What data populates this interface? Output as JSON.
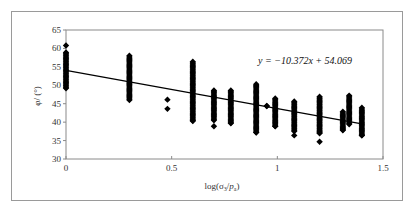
{
  "chart_data": {
    "type": "scatter",
    "title": "",
    "xlabel": "log(σ3/pa)",
    "ylabel": "φ/ (°)",
    "xlim": [
      0,
      1.5
    ],
    "ylim": [
      30,
      65
    ],
    "xticks": [
      0,
      0.5,
      1,
      1.5
    ],
    "xtick_labels": [
      "0",
      "0.5",
      "1",
      "1.5"
    ],
    "yticks": [
      30,
      35,
      40,
      45,
      50,
      55,
      60,
      65
    ],
    "ytick_labels": [
      "30",
      "35",
      "40",
      "45",
      "50",
      "55",
      "60",
      "65"
    ],
    "grid": false,
    "legend": null,
    "marker": "diamond",
    "marker_color": "#000000",
    "series": [
      {
        "name": "measured",
        "clusters": [
          {
            "x": 0.0,
            "y_min": 49.2,
            "y_max": 58.9,
            "extra": [
              60.8
            ]
          },
          {
            "x": 0.3,
            "y_min": 46.0,
            "y_max": 58.0,
            "extra": []
          },
          {
            "x": 0.48,
            "y_min": 43.6,
            "y_max": 46.1,
            "extra": [],
            "discrete": [
              43.6,
              46.1
            ]
          },
          {
            "x": 0.6,
            "y_min": 40.3,
            "y_max": 56.4,
            "extra": []
          },
          {
            "x": 0.7,
            "y_min": 40.5,
            "y_max": 48.6,
            "extra": [
              38.9
            ]
          },
          {
            "x": 0.78,
            "y_min": 39.7,
            "y_max": 48.6,
            "extra": []
          },
          {
            "x": 0.9,
            "y_min": 37.2,
            "y_max": 50.3,
            "extra": []
          },
          {
            "x": 0.95,
            "y_min": 44.4,
            "y_max": 44.4,
            "extra": []
          },
          {
            "x": 0.99,
            "y_min": 38.9,
            "y_max": 46.4,
            "extra": []
          },
          {
            "x": 1.08,
            "y_min": 37.5,
            "y_max": 45.6,
            "extra": [
              36.4
            ]
          },
          {
            "x": 1.2,
            "y_min": 37.0,
            "y_max": 46.9,
            "extra": [
              34.7
            ]
          },
          {
            "x": 1.31,
            "y_min": 37.8,
            "y_max": 42.8,
            "extra": []
          },
          {
            "x": 1.34,
            "y_min": 39.4,
            "y_max": 47.2,
            "extra": []
          },
          {
            "x": 1.4,
            "y_min": 36.4,
            "y_max": 43.9,
            "extra": []
          }
        ]
      }
    ],
    "trendline": {
      "type": "linear",
      "slope": -10.372,
      "intercept": 54.069,
      "x_range": [
        0,
        1.4
      ],
      "equation_label": "y = −10.372x + 54.069"
    },
    "annotations": [
      "y = −10.372x + 54.069"
    ]
  }
}
